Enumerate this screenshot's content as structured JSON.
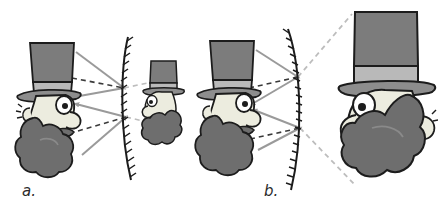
{
  "figure": {
    "background_color": "#ffffff",
    "width": 438,
    "height": 210
  },
  "palette": {
    "outline": "#1c1c1c",
    "hat_crown": "#7c7c7c",
    "hat_band": "#b9b9b9",
    "hat_brim": "#8d8d8d",
    "face": "#ececdf",
    "face_shadow": "#d8d8cb",
    "beard": "#6e6e6e",
    "beard_light": "#8a8a8a",
    "ray_solid": "#9a9a9a",
    "ray_dashed": "#3a3a3a",
    "projection_dashed": "#bdbdbd",
    "mirror_line": "#1c1c1c",
    "mirror_hatch": "#1c1c1c",
    "label_text": "#2b2b2b"
  },
  "panels": [
    {
      "id": "a",
      "label": "a.",
      "mirror_type": "convex",
      "mirror_description": "convex mirror bulging toward the object, hatching on the back side",
      "object": {
        "name": "man-with-top-hat",
        "facing": "right",
        "size": "full",
        "features": [
          "tall top hat",
          "hat band",
          "hat brim",
          "eye",
          "nose",
          "moustache",
          "full beard",
          "ear"
        ]
      },
      "image": {
        "name": "virtual-image-small",
        "facing": "left",
        "size": "reduced",
        "kind": "virtual, upright, diminished"
      },
      "rays": {
        "incident_count": 2,
        "reflected_count": 2,
        "extension_count": 2,
        "style_incident": "solid-gray-with-arrowheads",
        "style_extension": "dashed-dark"
      }
    },
    {
      "id": "b",
      "label": "b.",
      "mirror_type": "concave",
      "mirror_description": "concave mirror curving away from the object, hatching on the back side",
      "object": {
        "name": "man-with-top-hat",
        "facing": "right",
        "size": "full",
        "features": [
          "tall top hat",
          "hat band",
          "hat brim",
          "eye",
          "nose",
          "moustache",
          "full beard",
          "ear"
        ]
      },
      "image": {
        "name": "virtual-image-large",
        "facing": "left",
        "size": "magnified",
        "kind": "virtual, upright, enlarged"
      },
      "rays": {
        "incident_count": 2,
        "reflected_count": 2,
        "extension_count": 2,
        "style_incident": "solid-gray-with-arrowheads",
        "style_extension": "dashed-dark",
        "style_projection": "dashed-light-gray"
      }
    }
  ]
}
